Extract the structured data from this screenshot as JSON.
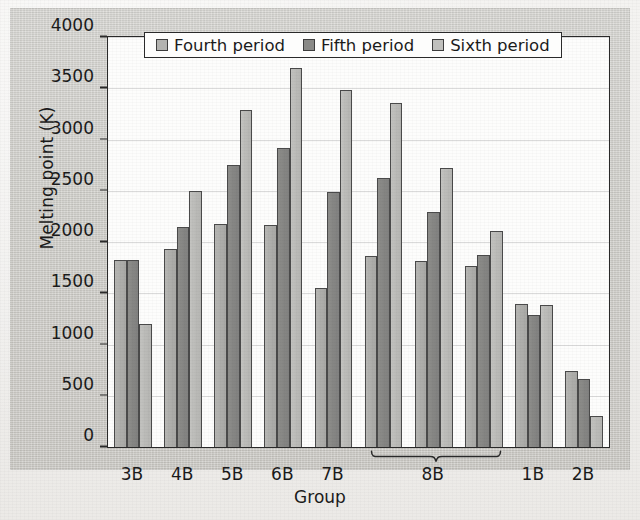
{
  "chart_data": {
    "type": "bar",
    "title": "",
    "xlabel": "Group",
    "ylabel": "Melting point (K)",
    "ylim": [
      0,
      4000
    ],
    "yticks": [
      0,
      500,
      1000,
      1500,
      2000,
      2500,
      3000,
      3500,
      4000
    ],
    "grid": true,
    "legend_position": "top-center-inside",
    "categories": [
      "3B",
      "4B",
      "5B",
      "6B",
      "7B",
      "8B",
      "8B",
      "8B",
      "1B",
      "2B"
    ],
    "tick_labels": [
      "3B",
      "4B",
      "5B",
      "6B",
      "7B",
      "8B",
      "1B",
      "2B"
    ],
    "group_bracket": {
      "label": "8B",
      "spans_clusters": 3,
      "from_cluster_index": 5,
      "to_cluster_index": 7
    },
    "series": [
      {
        "name": "Fourth period",
        "color": "#b3b3b0",
        "values": [
          1820,
          1930,
          2180,
          2170,
          1550,
          1860,
          1810,
          1770,
          1400,
          740
        ]
      },
      {
        "name": "Fifth period",
        "color": "#8a8a87",
        "values": [
          1820,
          2150,
          2750,
          2920,
          2490,
          2620,
          2290,
          1870,
          1290,
          660
        ]
      },
      {
        "name": "Sixth period",
        "color": "#c0c0bd",
        "values": [
          1200,
          2500,
          3290,
          3700,
          3480,
          3360,
          2720,
          2110,
          1390,
          300
        ]
      }
    ]
  },
  "legend": {
    "items": [
      {
        "label": "Fourth period"
      },
      {
        "label": "Fifth period"
      },
      {
        "label": "Sixth period"
      }
    ]
  },
  "axes": {
    "y_title": "Melting point (K)",
    "x_title": "Group",
    "y_tick_labels": [
      "4000",
      "3500",
      "3000",
      "2500",
      "2000",
      "1500",
      "1000",
      "500",
      "0"
    ],
    "x_tick_labels": [
      "3B",
      "4B",
      "5B",
      "6B",
      "7B",
      "8B",
      "1B",
      "2B"
    ]
  },
  "brace": {
    "label": "8B"
  }
}
